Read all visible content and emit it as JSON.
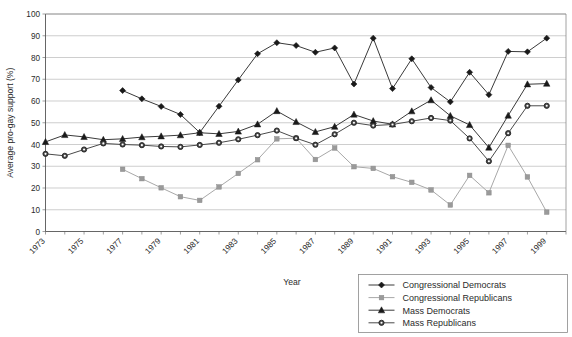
{
  "chart_data": {
    "type": "line",
    "title": "",
    "xlabel": "Year",
    "ylabel": "Average pro-gay support (%)",
    "xlim": [
      1973,
      2000
    ],
    "ylim": [
      0,
      100
    ],
    "ytick_step": 10,
    "yticks": [
      0,
      10,
      20,
      30,
      40,
      50,
      60,
      70,
      80,
      90,
      100
    ],
    "xticks": [
      1973,
      1975,
      1977,
      1979,
      1981,
      1983,
      1985,
      1987,
      1989,
      1991,
      1993,
      1995,
      1997,
      1999
    ],
    "xtick_labels": [
      "1973",
      "1975",
      "1977",
      "1979",
      "1981",
      "1983",
      "1985",
      "1987",
      "1989",
      "1991",
      "1993",
      "1995",
      "1997",
      "1999"
    ],
    "grid": "horizontal",
    "legend_position": "bottom-right",
    "series": [
      {
        "name": "Congressional Democrats",
        "marker": "diamond",
        "color": "#1a1a1a",
        "line_color": "#3a3a3a",
        "x": [
          1977,
          1978,
          1979,
          1980,
          1981,
          1982,
          1983,
          1984,
          1985,
          1986,
          1987,
          1988,
          1989,
          1990,
          1991,
          1992,
          1993,
          1994,
          1995,
          1996,
          1997,
          1998,
          1999
        ],
        "values": [
          64.8,
          61.0,
          57.5,
          53.8,
          45.5,
          57.6,
          69.7,
          81.7,
          86.8,
          85.5,
          82.4,
          84.4,
          67.8,
          88.9,
          65.7,
          79.4,
          66.2,
          59.6,
          73.2,
          62.9,
          82.8,
          82.6,
          88.9
        ]
      },
      {
        "name": "Congressional Republicans",
        "marker": "square",
        "color": "#9a9a9a",
        "line_color": "#a8a8a8",
        "x": [
          1977,
          1978,
          1979,
          1980,
          1981,
          1982,
          1983,
          1984,
          1985,
          1986,
          1987,
          1988,
          1989,
          1990,
          1991,
          1992,
          1993,
          1994,
          1995,
          1996,
          1997,
          1998,
          1999
        ],
        "values": [
          28.6,
          24.3,
          20.1,
          16.0,
          14.3,
          20.5,
          26.7,
          33.0,
          42.6,
          42.9,
          33.1,
          38.4,
          29.8,
          29.0,
          25.2,
          22.6,
          19.1,
          12.2,
          25.8,
          17.8,
          39.6,
          25.1,
          8.9
        ]
      },
      {
        "name": "Mass Democrats",
        "marker": "triangle",
        "color": "#1a1a1a",
        "line_color": "#3a3a3a",
        "x": [
          1973,
          1974,
          1975,
          1976,
          1977,
          1978,
          1979,
          1980,
          1981,
          1982,
          1983,
          1984,
          1985,
          1986,
          1987,
          1988,
          1989,
          1990,
          1991,
          1992,
          1993,
          1994,
          1995,
          1996,
          1997,
          1998,
          1999
        ],
        "values": [
          41.2,
          44.4,
          43.5,
          42.2,
          42.6,
          43.4,
          43.8,
          44.3,
          45.4,
          44.9,
          46.0,
          49.3,
          55.4,
          50.4,
          45.8,
          48.2,
          53.8,
          50.8,
          49.3,
          55.3,
          60.4,
          53.2,
          49.0,
          38.6,
          53.3,
          67.7,
          68.0
        ]
      },
      {
        "name": "Mass Republicans",
        "marker": "circle",
        "color": "#4a4a4a",
        "line_color": "#4a4a4a",
        "x": [
          1973,
          1974,
          1975,
          1976,
          1977,
          1978,
          1979,
          1980,
          1981,
          1982,
          1983,
          1984,
          1985,
          1986,
          1987,
          1988,
          1989,
          1990,
          1991,
          1992,
          1993,
          1994,
          1995,
          1996,
          1997,
          1998,
          1999
        ],
        "values": [
          35.7,
          34.8,
          37.7,
          40.5,
          40.0,
          39.7,
          39.1,
          38.9,
          39.8,
          40.8,
          42.4,
          44.3,
          46.4,
          42.9,
          39.9,
          44.7,
          50.0,
          48.7,
          49.2,
          50.7,
          52.2,
          51.0,
          42.8,
          32.3,
          45.2,
          57.8,
          57.8
        ]
      }
    ]
  },
  "legend": {
    "items": [
      {
        "label": "Congressional Democrats"
      },
      {
        "label": "Congressional Republicans"
      },
      {
        "label": "Mass Democrats"
      },
      {
        "label": "Mass Republicans"
      }
    ]
  }
}
